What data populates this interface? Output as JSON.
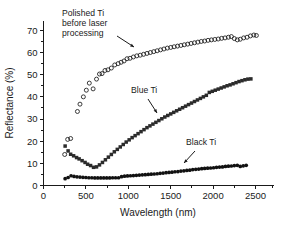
{
  "chart_data": {
    "type": "scatter",
    "title": "",
    "xlabel": "Wavelength (nm)",
    "ylabel": "Reflectance (%)",
    "xlim": [
      0,
      2700
    ],
    "ylim": [
      0,
      74
    ],
    "xticks": [
      0,
      500,
      1000,
      1500,
      2000,
      2500
    ],
    "yticks": [
      0,
      10,
      20,
      30,
      40,
      50,
      60,
      70
    ],
    "xtick_labels": [
      "0",
      "500",
      "1000",
      "1500",
      "2000",
      "2500"
    ],
    "ytick_labels": [
      "0",
      "10",
      "20",
      "30",
      "40",
      "50",
      "60",
      "70"
    ],
    "grid": false,
    "legend_position": "inline-annotations",
    "series": [
      {
        "name": "Polished Ti before laser processing",
        "marker": "open-circle",
        "color": "#1a1a1a",
        "points": [
          [
            250,
            14.0
          ],
          [
            285,
            20.8
          ],
          [
            320,
            21.2
          ],
          [
            400,
            33.4
          ],
          [
            430,
            36.7
          ],
          [
            470,
            40.0
          ],
          [
            505,
            43.0
          ],
          [
            540,
            46.2
          ],
          [
            585,
            43.6
          ],
          [
            625,
            48.0
          ],
          [
            660,
            50.3
          ],
          [
            690,
            50.5
          ],
          [
            725,
            51.9
          ],
          [
            760,
            52.2
          ],
          [
            800,
            53.0
          ],
          [
            840,
            54.4
          ],
          [
            880,
            55.0
          ],
          [
            915,
            55.6
          ],
          [
            950,
            56.2
          ],
          [
            985,
            57.2
          ],
          [
            1020,
            57.4
          ],
          [
            1060,
            58.0
          ],
          [
            1100,
            58.5
          ],
          [
            1140,
            58.8
          ],
          [
            1180,
            59.2
          ],
          [
            1220,
            59.6
          ],
          [
            1260,
            60.0
          ],
          [
            1300,
            60.4
          ],
          [
            1340,
            60.8
          ],
          [
            1380,
            61.2
          ],
          [
            1420,
            61.6
          ],
          [
            1460,
            62.0
          ],
          [
            1500,
            62.3
          ],
          [
            1540,
            62.6
          ],
          [
            1580,
            62.9
          ],
          [
            1620,
            63.2
          ],
          [
            1660,
            63.5
          ],
          [
            1700,
            63.8
          ],
          [
            1740,
            64.1
          ],
          [
            1780,
            64.4
          ],
          [
            1820,
            64.7
          ],
          [
            1860,
            65.0
          ],
          [
            1900,
            65.2
          ],
          [
            1940,
            65.5
          ],
          [
            1980,
            65.7
          ],
          [
            2020,
            65.9
          ],
          [
            2060,
            66.1
          ],
          [
            2100,
            66.4
          ],
          [
            2140,
            66.6
          ],
          [
            2180,
            66.9
          ],
          [
            2215,
            67.2
          ],
          [
            2250,
            66.3
          ],
          [
            2285,
            65.7
          ],
          [
            2320,
            66.0
          ],
          [
            2360,
            66.6
          ],
          [
            2400,
            66.9
          ],
          [
            2440,
            67.5
          ],
          [
            2480,
            67.9
          ],
          [
            2510,
            67.7
          ]
        ]
      },
      {
        "name": "Blue Ti",
        "marker": "filled-square",
        "color": "#2b2b2b",
        "points": [
          [
            255,
            17.8
          ],
          [
            290,
            15.6
          ],
          [
            320,
            14.1
          ],
          [
            355,
            13.4
          ],
          [
            390,
            12.6
          ],
          [
            420,
            12.0
          ],
          [
            455,
            11.2
          ],
          [
            490,
            10.4
          ],
          [
            520,
            9.6
          ],
          [
            555,
            9.0
          ],
          [
            590,
            8.2
          ],
          [
            625,
            8.4
          ],
          [
            660,
            9.3
          ],
          [
            695,
            10.4
          ],
          [
            730,
            11.6
          ],
          [
            765,
            12.8
          ],
          [
            800,
            14.0
          ],
          [
            835,
            15.2
          ],
          [
            870,
            16.3
          ],
          [
            905,
            17.4
          ],
          [
            940,
            18.5
          ],
          [
            975,
            19.6
          ],
          [
            1010,
            20.6
          ],
          [
            1045,
            21.6
          ],
          [
            1080,
            22.5
          ],
          [
            1115,
            23.4
          ],
          [
            1150,
            24.3
          ],
          [
            1185,
            25.2
          ],
          [
            1220,
            26.1
          ],
          [
            1255,
            26.9
          ],
          [
            1290,
            27.7
          ],
          [
            1325,
            28.5
          ],
          [
            1360,
            29.3
          ],
          [
            1395,
            30.1
          ],
          [
            1430,
            30.9
          ],
          [
            1465,
            31.6
          ],
          [
            1500,
            32.3
          ],
          [
            1535,
            33.0
          ],
          [
            1570,
            33.7
          ],
          [
            1605,
            34.4
          ],
          [
            1640,
            35.1
          ],
          [
            1675,
            35.8
          ],
          [
            1710,
            36.5
          ],
          [
            1745,
            37.2
          ],
          [
            1780,
            37.9
          ],
          [
            1815,
            38.6
          ],
          [
            1850,
            39.3
          ],
          [
            1885,
            40.0
          ],
          [
            1920,
            40.7
          ],
          [
            1955,
            42.0
          ],
          [
            1990,
            42.5
          ],
          [
            2025,
            43.0
          ],
          [
            2060,
            43.5
          ],
          [
            2095,
            44.0
          ],
          [
            2130,
            44.5
          ],
          [
            2165,
            45.0
          ],
          [
            2200,
            45.4
          ],
          [
            2235,
            45.9
          ],
          [
            2270,
            46.4
          ],
          [
            2305,
            46.9
          ],
          [
            2340,
            47.3
          ],
          [
            2375,
            47.7
          ],
          [
            2410,
            48.0
          ],
          [
            2445,
            48.1
          ]
        ]
      },
      {
        "name": "Black Ti",
        "marker": "filled-circle",
        "color": "#111111",
        "points": [
          [
            255,
            3.1
          ],
          [
            290,
            3.6
          ],
          [
            325,
            4.4
          ],
          [
            360,
            4.1
          ],
          [
            395,
            3.9
          ],
          [
            430,
            3.8
          ],
          [
            465,
            3.7
          ],
          [
            500,
            3.6
          ],
          [
            535,
            3.5
          ],
          [
            570,
            3.5
          ],
          [
            605,
            3.4
          ],
          [
            640,
            3.4
          ],
          [
            675,
            3.4
          ],
          [
            710,
            3.4
          ],
          [
            745,
            3.4
          ],
          [
            780,
            3.4
          ],
          [
            815,
            3.5
          ],
          [
            850,
            3.5
          ],
          [
            885,
            3.5
          ],
          [
            920,
            4.0
          ],
          [
            955,
            4.2
          ],
          [
            990,
            4.3
          ],
          [
            1025,
            4.4
          ],
          [
            1060,
            4.5
          ],
          [
            1095,
            4.6
          ],
          [
            1130,
            4.7
          ],
          [
            1165,
            4.8
          ],
          [
            1200,
            4.9
          ],
          [
            1235,
            5.0
          ],
          [
            1270,
            5.1
          ],
          [
            1305,
            5.2
          ],
          [
            1340,
            5.3
          ],
          [
            1375,
            5.5
          ],
          [
            1410,
            5.6
          ],
          [
            1445,
            5.8
          ],
          [
            1480,
            5.9
          ],
          [
            1515,
            6.0
          ],
          [
            1550,
            6.2
          ],
          [
            1585,
            6.3
          ],
          [
            1620,
            6.5
          ],
          [
            1655,
            6.6
          ],
          [
            1690,
            6.8
          ],
          [
            1725,
            6.9
          ],
          [
            1760,
            7.2
          ],
          [
            1795,
            7.3
          ],
          [
            1830,
            7.4
          ],
          [
            1865,
            7.6
          ],
          [
            1900,
            7.7
          ],
          [
            1935,
            7.8
          ],
          [
            1970,
            7.9
          ],
          [
            2005,
            8.0
          ],
          [
            2040,
            8.2
          ],
          [
            2075,
            8.3
          ],
          [
            2110,
            8.4
          ],
          [
            2145,
            8.6
          ],
          [
            2180,
            8.7
          ],
          [
            2215,
            8.8
          ],
          [
            2250,
            9.0
          ],
          [
            2285,
            9.1
          ],
          [
            2320,
            8.6
          ],
          [
            2355,
            8.9
          ],
          [
            2390,
            9.1
          ]
        ]
      }
    ],
    "annotations": [
      {
        "id": "polished-ti-label",
        "lines": [
          "Polished Ti",
          "before laser",
          "processing"
        ],
        "text_x": 62,
        "text_y": 16,
        "arrow": {
          "x1": 117,
          "y1": 36,
          "x2": 134,
          "y2": 47
        }
      },
      {
        "id": "blue-ti-label",
        "lines": [
          "Blue Ti"
        ],
        "text_x": 131,
        "text_y": 93,
        "arrow": {
          "x1": 148,
          "y1": 99,
          "x2": 157,
          "y2": 113
        }
      },
      {
        "id": "black-ti-label",
        "lines": [
          "Black Ti"
        ],
        "text_x": 186,
        "text_y": 145,
        "arrow": {
          "x1": 195,
          "y1": 151,
          "x2": 184,
          "y2": 163
        }
      }
    ]
  }
}
